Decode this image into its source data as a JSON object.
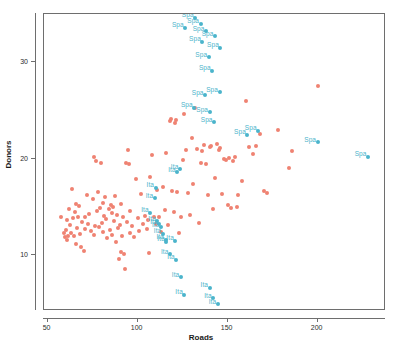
{
  "chart_data": {
    "type": "scatter",
    "title": "",
    "xlabel": "Roads",
    "ylabel": "Donors",
    "xlim": [
      48,
      238
    ],
    "ylim": [
      4.2,
      35.0
    ],
    "xticks": [
      50,
      100,
      150,
      200
    ],
    "xticklabels": [
      "50",
      "100",
      "150",
      "200"
    ],
    "yticks": [
      10,
      20,
      30
    ],
    "yticklabels": [
      "10",
      "20",
      "30"
    ],
    "grid": false,
    "legend": null,
    "colors": {
      "red": "#ef8272",
      "blue": "#4bb4cb",
      "axis": "#6e6e6e",
      "text": "#1a1a1a",
      "label_text": "#4bb4cb",
      "background": "#ffffff"
    },
    "annotation_labels": [
      "Spa",
      "Ita"
    ],
    "series": [
      {
        "name": "unlabeled-red",
        "color": "#ef8272",
        "points": [
          [
            57.5,
            14.0
          ],
          [
            59.0,
            12.3
          ],
          [
            59.5,
            11.9
          ],
          [
            60.0,
            12.6
          ],
          [
            60.5,
            11.6
          ],
          [
            61.0,
            13.6
          ],
          [
            61.5,
            12.0
          ],
          [
            62.0,
            14.8
          ],
          [
            62.5,
            13.1
          ],
          [
            63.0,
            12.3
          ],
          [
            63.5,
            16.9
          ],
          [
            64.0,
            13.8
          ],
          [
            64.5,
            12.0
          ],
          [
            65.0,
            14.5
          ],
          [
            65.5,
            11.1
          ],
          [
            66.0,
            15.3
          ],
          [
            66.5,
            12.8
          ],
          [
            67.0,
            13.9
          ],
          [
            67.5,
            15.1
          ],
          [
            68.0,
            12.2
          ],
          [
            68.5,
            10.8
          ],
          [
            69.0,
            13.4
          ],
          [
            70.0,
            10.4
          ],
          [
            70.5,
            14.0
          ],
          [
            71.0,
            12.7
          ],
          [
            72.0,
            16.2
          ],
          [
            72.5,
            13.2
          ],
          [
            73.0,
            14.3
          ],
          [
            74.0,
            12.5
          ],
          [
            75.0,
            15.8
          ],
          [
            75.5,
            12.1
          ],
          [
            76.0,
            20.2
          ],
          [
            76.5,
            13.0
          ],
          [
            77.0,
            19.8
          ],
          [
            77.5,
            14.6
          ],
          [
            78.0,
            16.5
          ],
          [
            78.5,
            12.9
          ],
          [
            79.0,
            14.9
          ],
          [
            79.5,
            19.6
          ],
          [
            80.0,
            13.3
          ],
          [
            80.5,
            15.4
          ],
          [
            81.0,
            12.4
          ],
          [
            81.5,
            14.1
          ],
          [
            82.0,
            16.0
          ],
          [
            82.5,
            13.7
          ],
          [
            83.0,
            11.8
          ],
          [
            84.0,
            14.8
          ],
          [
            84.5,
            12.6
          ],
          [
            85.0,
            15.2
          ],
          [
            85.5,
            14.4
          ],
          [
            86.0,
            12.1
          ],
          [
            86.5,
            15.0
          ],
          [
            87.0,
            13.5
          ],
          [
            87.5,
            16.1
          ],
          [
            88.0,
            11.4
          ],
          [
            88.5,
            14.2
          ],
          [
            89.0,
            12.8
          ],
          [
            89.5,
            9.6
          ],
          [
            90.0,
            13.1
          ],
          [
            90.5,
            10.3
          ],
          [
            91.0,
            15.3
          ],
          [
            91.5,
            12.0
          ],
          [
            92.0,
            14.0
          ],
          [
            92.5,
            10.1
          ],
          [
            93.0,
            8.6
          ],
          [
            93.5,
            19.5
          ],
          [
            94.0,
            13.4
          ],
          [
            94.5,
            20.9
          ],
          [
            95.0,
            19.4
          ],
          [
            95.5,
            12.3
          ],
          [
            96.0,
            14.6
          ],
          [
            97.0,
            13.0
          ],
          [
            98.0,
            11.9
          ],
          [
            99.0,
            17.9
          ],
          [
            100.0,
            13.8
          ],
          [
            101.0,
            12.5
          ],
          [
            102.0,
            16.3
          ],
          [
            103.0,
            13.2
          ],
          [
            104.0,
            14.1
          ],
          [
            105.0,
            12.7
          ],
          [
            106.0,
            13.6
          ],
          [
            106.5,
            10.2
          ],
          [
            107.0,
            18.1
          ],
          [
            108.0,
            20.4
          ],
          [
            109.0,
            14.0
          ],
          [
            110.0,
            13.2
          ],
          [
            111.0,
            16.7
          ],
          [
            112.0,
            13.9
          ],
          [
            113.0,
            12.4
          ],
          [
            114.0,
            17.1
          ],
          [
            115.0,
            14.7
          ],
          [
            116.0,
            20.6
          ],
          [
            117.0,
            13.1
          ],
          [
            118.0,
            23.9
          ],
          [
            118.5,
            24.1
          ],
          [
            119.0,
            16.6
          ],
          [
            120.0,
            14.5
          ],
          [
            121.0,
            23.7
          ],
          [
            121.5,
            24.0
          ],
          [
            122.0,
            16.5
          ],
          [
            123.0,
            12.3
          ],
          [
            124.0,
            13.9
          ],
          [
            125.0,
            19.9
          ],
          [
            126.0,
            24.6
          ],
          [
            127.0,
            20.9
          ],
          [
            128.0,
            16.4
          ],
          [
            129.0,
            14.2
          ],
          [
            130.0,
            22.1
          ],
          [
            131.0,
            17.4
          ],
          [
            132.0,
            25.3
          ],
          [
            133.0,
            21.0
          ],
          [
            134.0,
            13.3
          ],
          [
            135.0,
            19.5
          ],
          [
            136.0,
            20.8
          ],
          [
            137.0,
            21.4
          ],
          [
            138.0,
            19.4
          ],
          [
            139.0,
            16.2
          ],
          [
            140.0,
            21.2
          ],
          [
            141.0,
            21.3
          ],
          [
            142.0,
            14.8
          ],
          [
            143.0,
            18.0
          ],
          [
            144.0,
            21.5
          ],
          [
            145.0,
            20.9
          ],
          [
            146.0,
            21.1
          ],
          [
            147.0,
            16.3
          ],
          [
            148.0,
            20.0
          ],
          [
            149.0,
            19.9
          ],
          [
            150.0,
            15.2
          ],
          [
            151.0,
            20.1
          ],
          [
            152.0,
            14.9
          ],
          [
            153.0,
            19.8
          ],
          [
            154.0,
            20.2
          ],
          [
            155.0,
            15.0
          ],
          [
            156.0,
            16.2
          ],
          [
            158.0,
            17.7
          ],
          [
            160.0,
            26.0
          ],
          [
            162.0,
            21.2
          ],
          [
            164.0,
            20.5
          ],
          [
            166.0,
            21.3
          ],
          [
            168.0,
            22.6
          ],
          [
            170.0,
            16.6
          ],
          [
            172.0,
            16.4
          ],
          [
            178.0,
            23.0
          ],
          [
            184.0,
            19.0
          ],
          [
            186.0,
            20.8
          ],
          [
            200.0,
            27.5
          ]
        ]
      },
      {
        "name": "Spa",
        "color": "#4bb4cb",
        "label": "Spa",
        "points": [
          [
            126.5,
            33.6
          ],
          [
            132.0,
            34.6
          ],
          [
            135.0,
            34.0
          ],
          [
            138.0,
            33.2
          ],
          [
            136.0,
            32.1
          ],
          [
            143.0,
            32.7
          ],
          [
            146.0,
            31.5
          ],
          [
            139.5,
            30.5
          ],
          [
            141.5,
            29.1
          ],
          [
            137.5,
            26.6
          ],
          [
            145.5,
            26.9
          ],
          [
            131.5,
            25.3
          ],
          [
            140.0,
            24.8
          ],
          [
            142.5,
            23.8
          ],
          [
            161.0,
            22.5
          ],
          [
            167.0,
            22.9
          ],
          [
            200.0,
            21.7
          ],
          [
            228.0,
            20.2
          ]
        ]
      },
      {
        "name": "Ita",
        "color": "#4bb4cb",
        "label": "Ita",
        "points": [
          [
            122.0,
            18.6
          ],
          [
            123.5,
            18.9
          ],
          [
            110.0,
            17.0
          ],
          [
            109.5,
            15.9
          ],
          [
            107.0,
            14.4
          ],
          [
            111.0,
            13.5
          ],
          [
            112.0,
            13.2
          ],
          [
            113.0,
            12.9
          ],
          [
            114.0,
            12.2
          ],
          [
            115.5,
            11.6
          ],
          [
            116.0,
            11.4
          ],
          [
            121.0,
            11.5
          ],
          [
            118.0,
            10.1
          ],
          [
            121.5,
            9.5
          ],
          [
            124.0,
            7.7
          ],
          [
            126.0,
            5.9
          ],
          [
            140.0,
            6.6
          ],
          [
            142.0,
            5.5
          ],
          [
            144.5,
            4.9
          ]
        ]
      }
    ]
  },
  "axes": {
    "x_title": "Roads",
    "y_title": "Donors"
  }
}
